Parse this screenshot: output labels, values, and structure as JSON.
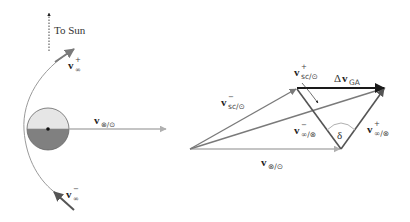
{
  "left_panel": {
    "sun_direction_label": "To Sun",
    "outgoing_velocity": {
      "symbol": "v",
      "subscript": "∞",
      "superscript": "+"
    },
    "incoming_velocity": {
      "symbol": "v",
      "subscript": "∞",
      "superscript": "−"
    },
    "planet_velocity": {
      "symbol": "v",
      "subscript": "⊗/⊙"
    }
  },
  "right_panel": {
    "sc_velocity_before": {
      "symbol": "v",
      "subscript": "sc/⊙",
      "superscript": "−"
    },
    "sc_velocity_after": {
      "symbol": "v",
      "subscript": "sc/⊙",
      "superscript": "+"
    },
    "delta_v": {
      "prefix": "Δ",
      "symbol": "v",
      "subscript": "GA"
    },
    "vinf_before": {
      "symbol": "v",
      "subscript": "∞/⊗",
      "superscript": "−"
    },
    "vinf_after": {
      "symbol": "v",
      "subscript": "∞/⊗",
      "superscript": "+"
    },
    "turn_angle": "δ",
    "planet_velocity": {
      "symbol": "v",
      "subscript": "⊗/⊙"
    }
  },
  "colors": {
    "vector_gray": "#7a7a7a",
    "light_gray": "#b0b0b0",
    "dark_vector": "#555555",
    "delta_v": "#1a1a1a",
    "planet_light": "#e6e6e6",
    "planet_dark": "#808080"
  }
}
